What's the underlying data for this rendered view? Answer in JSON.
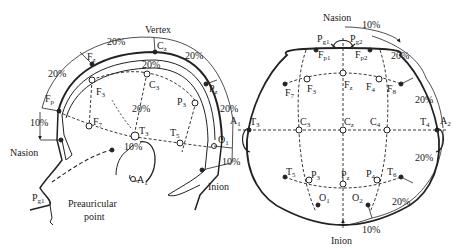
{
  "side_view": {
    "labels": {
      "vertex": "Vertex",
      "nasion": "Nasion",
      "inion": "Inion",
      "preauricular_1": "Preauricular",
      "preauricular_2": "point"
    },
    "electrodes": {
      "Fp": "F",
      "Fp_sub": "p",
      "Fz": "F",
      "Fz_sub": "z",
      "Cz": "C",
      "Cz_sub": "z",
      "Pz": "P",
      "Pz_sub": "z",
      "F3": "F",
      "F3_sub": "3",
      "C3": "C",
      "C3_sub": "3",
      "P3": "P",
      "P3_sub": "3",
      "F7": "F",
      "F7_sub": "7",
      "T3": "T",
      "T3_sub": "3",
      "T5": "T",
      "T5_sub": "5",
      "O1": "O",
      "O1_sub": "1",
      "A1": "A",
      "A1_sub": "1",
      "Pg1": "P",
      "Pg1_sub": "g1"
    },
    "percentages": {
      "p1": "20%",
      "p2": "20%",
      "p3": "20%",
      "p4": "20%",
      "p5": "10%",
      "p6": "10%",
      "p7": "20%",
      "p8": "20%",
      "p9": "10%"
    }
  },
  "top_view": {
    "labels": {
      "nasion": "Nasion",
      "inion": "Inion"
    },
    "electrodes": {
      "Pg1": "P",
      "Pg1_sub": "g1",
      "Pg2": "P",
      "Pg2_sub": "g2",
      "Fp1": "F",
      "Fp1_sub": "p1",
      "Fp2": "F",
      "Fp2_sub": "p2",
      "F7": "F",
      "F7_sub": "7",
      "F3": "F",
      "F3_sub": "3",
      "Fz": "F",
      "Fz_sub": "z",
      "F4": "F",
      "F4_sub": "4",
      "F8": "F",
      "F8_sub": "8",
      "A1": "A",
      "A1_sub": "1",
      "T3": "T",
      "T3_sub": "3",
      "C3": "C",
      "C3_sub": "3",
      "Cz": "C",
      "Cz_sub": "z",
      "C4": "C",
      "C4_sub": "4",
      "T4": "T",
      "T4_sub": "4",
      "A2": "A",
      "A2_sub": "2",
      "T5": "T",
      "T5_sub": "5",
      "P3": "P",
      "P3_sub": "3",
      "Pz": "P",
      "Pz_sub": "z",
      "P4": "P",
      "P4_sub": "4",
      "T6": "T",
      "T6_sub": "6",
      "O1": "O",
      "O1_sub": "1",
      "O2": "O",
      "O2_sub": "2"
    },
    "percentages": {
      "t1": "10%",
      "t2": "20%",
      "t3": "20%",
      "t4": "20%",
      "t5": "20%",
      "t6": "10%"
    }
  }
}
